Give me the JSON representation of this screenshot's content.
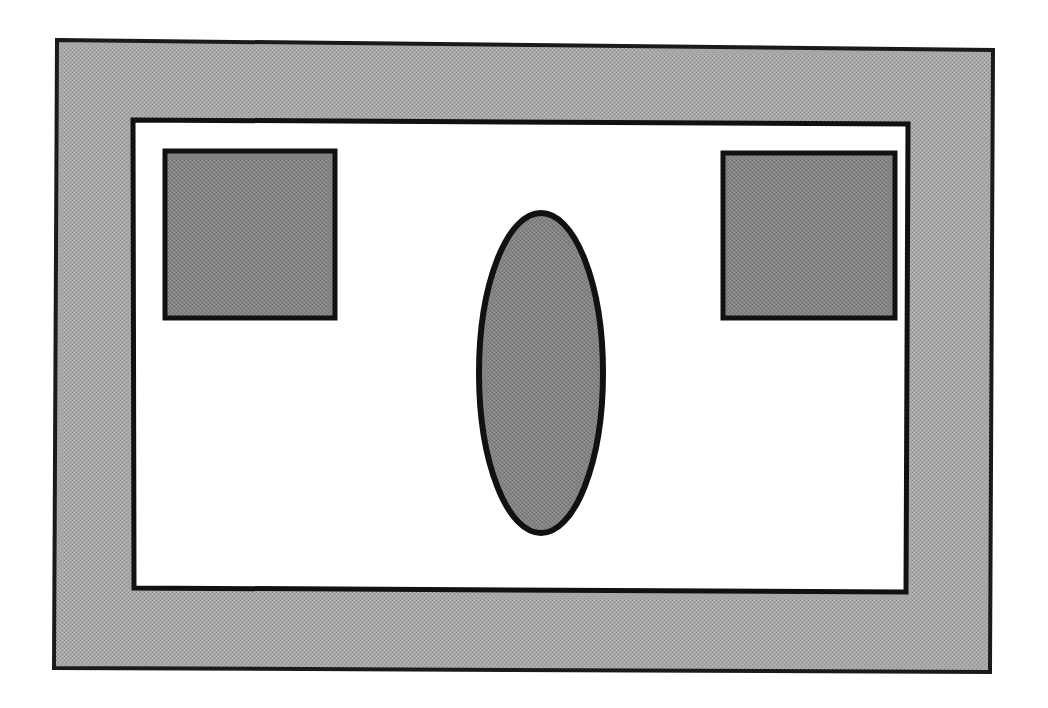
{
  "document": {
    "title": "Schematic floor plan diagram",
    "canvas": {
      "width": 1048,
      "height": 708,
      "background": "#ffffff"
    }
  },
  "palette": {
    "page_background": "#ffffff",
    "outer_border_fill": "#a3a3a3",
    "outer_border_stroke": "#1a1a1a",
    "inner_area_fill": "#ffffff",
    "inner_area_stroke": "#111111",
    "shape_fill": "#808080",
    "shape_stroke": "#111111"
  },
  "shapes": [
    {
      "id": "outer-frame",
      "name": "outer-frame-band",
      "type": "quadrilateral",
      "label": "Outer gray border band",
      "fill": "#a3a3a3",
      "stroke": "#1a1a1a",
      "stroke_width": 4,
      "points": "57,40 993,50 990,672 54,668"
    },
    {
      "id": "inner-area",
      "name": "inner-white-area",
      "type": "quadrilateral",
      "label": "Inner white area",
      "fill": "#ffffff",
      "stroke": "#111111",
      "stroke_width": 5,
      "points": "133,120 908,124 906,592 134,588"
    },
    {
      "id": "rect-left",
      "name": "left-gray-rectangle",
      "type": "rectangle",
      "label": "Left gray rectangle",
      "fill": "#808080",
      "stroke": "#111111",
      "stroke_width": 5,
      "x": 165,
      "y": 151,
      "width": 170,
      "height": 167
    },
    {
      "id": "rect-right",
      "name": "right-gray-rectangle",
      "type": "rectangle",
      "label": "Right gray rectangle",
      "fill": "#808080",
      "stroke": "#111111",
      "stroke_width": 5,
      "x": 723,
      "y": 153,
      "width": 172,
      "height": 165
    },
    {
      "id": "ellipse-center",
      "name": "center-gray-ellipse",
      "type": "ellipse",
      "label": "Center gray ellipse",
      "fill": "#808080",
      "stroke": "#111111",
      "stroke_width": 6,
      "cx": 541,
      "cy": 373,
      "rx": 62,
      "ry": 160
    }
  ]
}
